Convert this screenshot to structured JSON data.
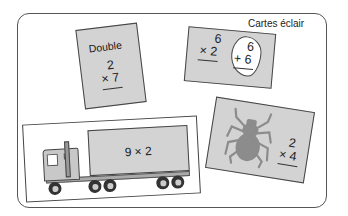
{
  "title": "Cartes éclair",
  "cards": [
    {
      "id": "double",
      "word": "Double",
      "top": "2",
      "bottom": "× 7"
    },
    {
      "id": "six-times-two",
      "top": "6",
      "bottom": "× 2",
      "cloud": {
        "top": "6",
        "bottom": "+ 6"
      }
    },
    {
      "id": "truck",
      "label": "9 × 2",
      "image": "truck-icon"
    },
    {
      "id": "spider",
      "top": "2",
      "bottom": "× 4",
      "image": "spider-icon"
    }
  ],
  "colors": {
    "card": "#d3d3d3",
    "border": "#444444",
    "frame": "#555555"
  }
}
